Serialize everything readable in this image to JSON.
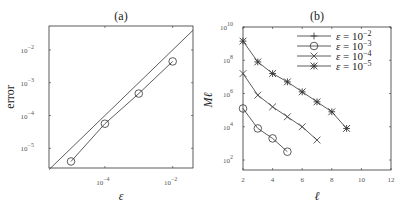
{
  "chart_data": [
    {
      "type": "line",
      "title": "(a)",
      "xlabel": "ε",
      "ylabel": "error",
      "xscale": "log",
      "yscale": "log",
      "xlim_log10": [
        -5.65,
        -1.4
      ],
      "ylim_log10": [
        -5.6,
        -1.27
      ],
      "x_ticks": [
        {
          "base": "10",
          "exp": "−4",
          "log": -4
        },
        {
          "base": "10",
          "exp": "−2",
          "log": -2
        }
      ],
      "y_ticks": [
        {
          "base": "10",
          "exp": "−2",
          "log": -2
        },
        {
          "base": "10",
          "exp": "−3",
          "log": -3
        },
        {
          "base": "10",
          "exp": "−4",
          "log": -4
        },
        {
          "base": "10",
          "exp": "−5",
          "log": -5
        }
      ],
      "grid": false,
      "series": [
        {
          "name": "reference (error = ε)",
          "marker": "none",
          "x_log10": [
            -5.65,
            -1.4
          ],
          "y_log10": [
            -5.65,
            -1.4
          ]
        },
        {
          "name": "error",
          "marker": "circle",
          "x": [
            1e-05,
            0.0001,
            0.001,
            0.01
          ],
          "x_log10": [
            -5,
            -4,
            -3,
            -2
          ],
          "y_log10": [
            -5.4,
            -4.25,
            -3.33,
            -2.35
          ]
        }
      ]
    },
    {
      "type": "line",
      "title": "(b)",
      "xlabel": "ℓ",
      "ylabel": "Mℓ",
      "xscale": "linear",
      "yscale": "log",
      "xlim": [
        2,
        12
      ],
      "ylim_log10": [
        1.4,
        10
      ],
      "x_ticks": [
        "2",
        "4",
        "6",
        "8",
        "10",
        "12"
      ],
      "y_ticks": [
        {
          "base": "10",
          "exp": "10",
          "log": 10
        },
        {
          "base": "10",
          "exp": "8",
          "log": 8
        },
        {
          "base": "10",
          "exp": "6",
          "log": 6
        },
        {
          "base": "10",
          "exp": "4",
          "log": 4
        },
        {
          "base": "10",
          "exp": "2",
          "log": 2
        }
      ],
      "grid": false,
      "legend_position": "upper right",
      "legend": [
        {
          "marker": "plus",
          "text": "ε = 10",
          "exp": "−2"
        },
        {
          "marker": "circle",
          "text": "ε = 10",
          "exp": "−3"
        },
        {
          "marker": "x",
          "text": "ε = 10",
          "exp": "−4"
        },
        {
          "marker": "star",
          "text": "ε = 10",
          "exp": "−5"
        }
      ],
      "series": [
        {
          "name": "ε = 10^-3",
          "marker": "circle",
          "x": [
            2,
            3,
            4,
            5
          ],
          "y_log10": [
            5.1,
            3.9,
            3.3,
            2.5
          ]
        },
        {
          "name": "ε = 10^-4",
          "marker": "x",
          "x": [
            2,
            3,
            4,
            5,
            6,
            7
          ],
          "y_log10": [
            7.2,
            5.9,
            5.2,
            4.6,
            4.0,
            3.2
          ]
        },
        {
          "name": "ε = 10^-5",
          "marker": "star",
          "x": [
            2,
            3,
            4,
            5,
            6,
            7,
            8,
            9
          ],
          "y_log10": [
            9.15,
            7.9,
            7.2,
            6.7,
            6.1,
            5.5,
            4.9,
            3.9
          ]
        }
      ]
    }
  ],
  "colors": {
    "line": "#333333",
    "axis": "#333333",
    "background": "#ffffff"
  }
}
